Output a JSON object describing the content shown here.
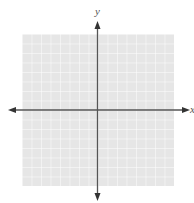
{
  "figure": {
    "type": "blank coordinate plane",
    "top_text_partial": "",
    "x_axis_label": "x",
    "y_axis_label": "y",
    "grid": {
      "columns": 16,
      "rows": 16,
      "fill_color": "#e6e6e6",
      "line_color": "#ffffff"
    },
    "axis_color": "#555555",
    "arrows": "both ends on both axes"
  }
}
